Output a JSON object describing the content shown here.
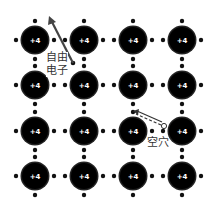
{
  "diagram": {
    "title": "",
    "atom_charge_label": "+4",
    "grid": {
      "columns": [
        35,
        84,
        133,
        182
      ],
      "rows": [
        40,
        85,
        131,
        176
      ]
    },
    "atom_radius": 13,
    "electron_offset": 19,
    "free_electron": {
      "label_line1": "自由",
      "label_line2": "电子",
      "arrow_from": [
        73,
        63
      ],
      "arrow_to": [
        49,
        16
      ]
    },
    "hole": {
      "label": "空穴",
      "position": [
        164,
        126
      ],
      "arrow_from": [
        162,
        124
      ],
      "arrow_to": [
        133,
        111
      ]
    },
    "colors": {
      "atom": "#000000",
      "electron": "#111111",
      "arrow": "#444444",
      "text": "#333333"
    }
  }
}
